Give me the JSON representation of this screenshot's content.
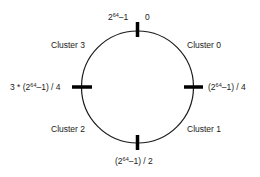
{
  "diagram": {
    "title": "",
    "ring": {
      "cx": 137.5,
      "cy": 87,
      "r": 56,
      "stroke": "#1a1a1a"
    },
    "tick_color": "#000000",
    "ticks": [
      {
        "position": "top",
        "label_left": "2^64–1",
        "label_right": "0"
      },
      {
        "position": "right",
        "label": "(2^64–1) / 4"
      },
      {
        "position": "bottom",
        "label": "(2^64–1) / 2"
      },
      {
        "position": "left",
        "label": "3 * (2^64–1) / 4"
      }
    ],
    "clusters": [
      {
        "name": "Cluster 0",
        "quadrant": "top-right"
      },
      {
        "name": "Cluster 1",
        "quadrant": "bottom-right"
      },
      {
        "name": "Cluster 2",
        "quadrant": "bottom-left"
      },
      {
        "name": "Cluster 3",
        "quadrant": "top-left"
      }
    ],
    "text": {
      "cluster0": "Cluster 0",
      "cluster1": "Cluster 1",
      "cluster2": "Cluster 2",
      "cluster3": "Cluster 3",
      "top_right": "0",
      "base": "2",
      "exp": "64",
      "minus_one": "–1",
      "right_suffix": "–1) / 4",
      "bottom_suffix": "–1) / 2",
      "left_prefix": "3 * (",
      "left_suffix": "–1) / 4",
      "open_paren": "("
    }
  }
}
